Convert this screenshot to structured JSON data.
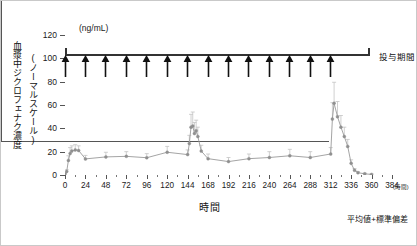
{
  "chart_data": {
    "type": "line",
    "title": "",
    "xlabel": "時間",
    "xunit": "(時間)",
    "ylabel_outer": "血漿中ジクロフェナク濃度",
    "ylabel_inner": "(ノーマルスケール)",
    "yunit": "(ng/mL)",
    "xlim": [
      0,
      384
    ],
    "ylim": [
      0,
      120
    ],
    "xticks": [
      0,
      24,
      48,
      72,
      96,
      120,
      144,
      168,
      192,
      216,
      240,
      264,
      288,
      312,
      336,
      360,
      384
    ],
    "xtick_labels": [
      "0",
      "24",
      "48",
      "72",
      "96",
      "120",
      "144",
      "168",
      "192",
      "216",
      "240",
      "264",
      "288",
      "312",
      "336",
      "360",
      "384"
    ],
    "yticks": [
      0,
      20,
      40,
      60,
      80,
      100,
      120
    ],
    "ytick_labels": [
      "0",
      "20",
      "40",
      "60",
      "80",
      "100",
      "120"
    ],
    "grid": false,
    "legend": "",
    "error_bars": "mean + standard deviation",
    "series": [
      {
        "name": "血漿中ジクロフェナク濃度",
        "color": "#9a9a9a",
        "x": [
          0,
          2,
          4,
          6,
          8,
          12,
          16,
          24,
          48,
          72,
          96,
          120,
          144,
          146,
          148,
          150,
          152,
          154,
          156,
          160,
          168,
          192,
          216,
          240,
          264,
          288,
          312,
          314,
          316,
          320,
          324,
          328,
          332,
          336,
          340,
          344,
          352,
          360
        ],
        "y": [
          0.8,
          3.0,
          12.5,
          18.5,
          20.5,
          21.5,
          21.0,
          13.8,
          15.5,
          16.0,
          14.8,
          19.5,
          17.5,
          27.0,
          41.0,
          42.0,
          35.5,
          38.0,
          33.0,
          20.5,
          14.0,
          11.5,
          14.0,
          15.0,
          16.5,
          15.0,
          18.0,
          48.0,
          61.5,
          50.0,
          41.0,
          33.0,
          24.5,
          10.0,
          4.0,
          2.0,
          1.0,
          0.5
        ],
        "yerr": [
          0.5,
          1.5,
          4.0,
          5.0,
          4.5,
          4.5,
          4.0,
          3.0,
          4.0,
          4.0,
          3.5,
          5.0,
          4.0,
          7.0,
          11.0,
          12.0,
          9.5,
          9.0,
          8.0,
          5.0,
          4.0,
          3.5,
          4.0,
          5.0,
          5.5,
          5.0,
          5.5,
          14.0,
          18.0,
          13.0,
          10.0,
          8.0,
          6.0,
          3.0,
          1.5,
          1.0,
          0.6,
          0.4
        ]
      }
    ],
    "annotations": {
      "dose_period_label": "投与期間",
      "dose_arrow_times": [
        0,
        24,
        48,
        72,
        96,
        120,
        144,
        168,
        192,
        216,
        240,
        264,
        288,
        312
      ],
      "footnote": "平均値+標準偏差"
    }
  }
}
